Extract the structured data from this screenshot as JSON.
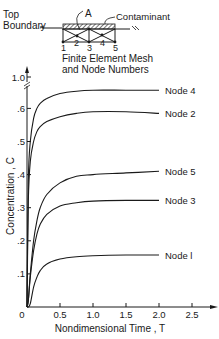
{
  "inset": {
    "top_boundary_label_1": "Top",
    "top_boundary_label_2": "Boundary",
    "point_label": "A",
    "contaminant_label": "Contaminant",
    "node_numbers": [
      "1",
      "2",
      "3",
      "4",
      "5"
    ],
    "caption_1": "Finite Element Mesh",
    "caption_2": "and Node Numbers"
  },
  "chart_data": {
    "type": "line",
    "title": "",
    "xlabel": "Nondimensional Time , T",
    "ylabel": "Concentration , C",
    "xlim": [
      0,
      2.7
    ],
    "ylim": [
      0,
      1.0
    ],
    "y_axis_break": "between 0.65 and 1.0",
    "x_ticks": [
      "0",
      "0.5",
      "1.0",
      "1.5",
      "2.0",
      "2.5"
    ],
    "y_ticks": [
      ".1",
      ".2",
      ".3",
      ".4",
      ".5",
      ".6",
      "1.0"
    ],
    "grid": false,
    "legend_position": "inline labels at right end of curves",
    "x": [
      0.0,
      0.02,
      0.05,
      0.1,
      0.15,
      0.2,
      0.3,
      0.5,
      0.75,
      1.0,
      1.5,
      2.0
    ],
    "series": [
      {
        "name": "Node 4",
        "values": [
          0.0,
          0.38,
          0.5,
          0.57,
          0.6,
          0.615,
          0.63,
          0.645,
          0.652,
          0.655,
          0.655,
          0.655
        ]
      },
      {
        "name": "Node 2",
        "values": [
          0.0,
          0.32,
          0.44,
          0.5,
          0.53,
          0.545,
          0.56,
          0.575,
          0.585,
          0.59,
          0.59,
          0.585
        ]
      },
      {
        "name": "Node 5",
        "values": [
          0.0,
          0.02,
          0.1,
          0.2,
          0.26,
          0.3,
          0.34,
          0.375,
          0.395,
          0.4,
          0.405,
          0.41
        ]
      },
      {
        "name": "Node 3",
        "values": [
          0.0,
          0.02,
          0.09,
          0.17,
          0.22,
          0.25,
          0.28,
          0.305,
          0.315,
          0.32,
          0.322,
          0.322
        ]
      },
      {
        "name": "Node 1",
        "values": [
          0.0,
          0.0,
          0.01,
          0.06,
          0.09,
          0.11,
          0.13,
          0.145,
          0.152,
          0.155,
          0.157,
          0.157
        ]
      }
    ],
    "series_labels": [
      "Node 4",
      "Node 2",
      "Node 5",
      "Node 3",
      "Node l"
    ]
  }
}
